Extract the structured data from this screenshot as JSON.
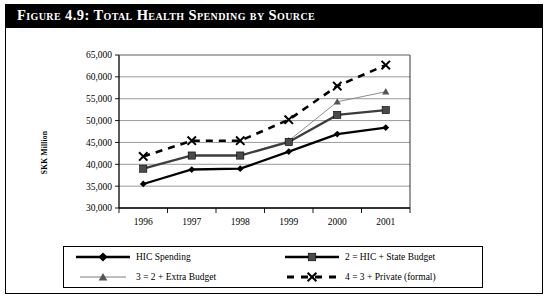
{
  "figure": {
    "title": "Figure 4.9:  Total Health Spending by Source"
  },
  "chart_data": {
    "type": "line",
    "title": "Total Health Spending by Source",
    "xlabel": "",
    "ylabel": "SKK Million",
    "categories": [
      "1996",
      "1997",
      "1998",
      "1999",
      "2000",
      "2001"
    ],
    "ylim": [
      30000,
      65000
    ],
    "ytick_step": 5000,
    "ytick_labels": [
      "30,000",
      "35,000",
      "40,000",
      "45,000",
      "50,000",
      "55,000",
      "60,000",
      "65,000"
    ],
    "ytick_values": [
      30000,
      35000,
      40000,
      45000,
      50000,
      55000,
      60000,
      65000
    ],
    "grid": true,
    "legend_position": "bottom",
    "series": [
      {
        "name": "HIC Spending",
        "marker": "diamond",
        "style": "solid-thick",
        "color": "#000000",
        "values": [
          35500,
          38800,
          39000,
          42900,
          46900,
          48400
        ]
      },
      {
        "name": "2 = HIC + State Budget",
        "marker": "square",
        "style": "solid-thick",
        "color": "#3d3d3d",
        "values": [
          39000,
          42000,
          42000,
          45100,
          51300,
          52400
        ]
      },
      {
        "name": "3 = 2 + Extra Budget",
        "marker": "triangle",
        "style": "solid-thin",
        "color": "#808080",
        "values": [
          39000,
          42000,
          42000,
          45400,
          54300,
          56600
        ]
      },
      {
        "name": "4 = 3 + Private (formal)",
        "marker": "cross",
        "style": "dashed",
        "color": "#000000",
        "values": [
          41800,
          45400,
          45400,
          50200,
          57900,
          62700
        ]
      }
    ]
  },
  "legend": {
    "items": [
      {
        "label": "HIC Spending",
        "marker": "diamond-marker",
        "sample": "solid-thick"
      },
      {
        "label": "2 = HIC + State Budget",
        "marker": "square-marker",
        "sample": "solid-thick"
      },
      {
        "label": "3 = 2 + Extra Budget",
        "marker": "triangle-marker",
        "sample": "solid-thin"
      },
      {
        "label": "4 = 3 + Private (formal)",
        "marker": "cross-marker",
        "sample": "dashed"
      }
    ]
  }
}
